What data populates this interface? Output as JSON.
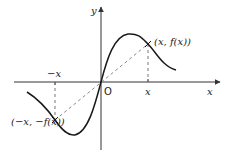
{
  "figure": {
    "axes": {
      "x_label": "x",
      "y_label": "y",
      "origin_label": "O"
    },
    "ticks": {
      "positive_x": "x",
      "negative_x": "−x"
    },
    "points": [
      {
        "label": "(x, f(x))",
        "quadrant": "I"
      },
      {
        "label": "(−x, −f(x))",
        "quadrant": "III"
      }
    ],
    "colors": {
      "axis": "#333333",
      "curve": "#1a1a1a",
      "dashed": "#777777",
      "text": "#222222"
    }
  }
}
